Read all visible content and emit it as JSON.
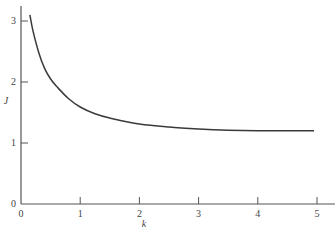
{
  "chart_data": {
    "type": "line",
    "title": "",
    "xlabel": "k",
    "ylabel": "J",
    "xlim": [
      0,
      5.1
    ],
    "ylim": [
      0,
      3.3
    ],
    "grid": false,
    "legend": null,
    "x_ticks": [
      "0",
      "1",
      "2",
      "3",
      "4",
      "5"
    ],
    "y_ticks": [
      "0",
      "1",
      "2",
      "3"
    ],
    "series": [
      {
        "name": "J(k)",
        "x": [
          0.15,
          0.2,
          0.3,
          0.4,
          0.5,
          0.6,
          0.8,
          1.0,
          1.25,
          1.5,
          2.0,
          2.5,
          3.0,
          3.5,
          4.0,
          4.5,
          4.95
        ],
        "y": [
          3.1,
          2.85,
          2.48,
          2.22,
          2.05,
          1.93,
          1.73,
          1.59,
          1.48,
          1.41,
          1.31,
          1.26,
          1.23,
          1.21,
          1.2,
          1.2,
          1.2
        ]
      }
    ]
  }
}
